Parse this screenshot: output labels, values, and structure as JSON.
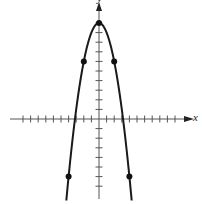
{
  "chart_data": {
    "type": "line",
    "title": "",
    "xlabel": "x",
    "ylabel": "y",
    "function": "y = 10 - x^2",
    "xlim": [
      -10,
      10
    ],
    "ylim": [
      -8,
      10
    ],
    "x_tick_step": 1,
    "y_tick_step": 1,
    "grid": false,
    "legend": null,
    "series": [
      {
        "name": "parabola",
        "x": [
          -4.3,
          -4,
          -3,
          -2,
          -1,
          0,
          1,
          2,
          3,
          4,
          4.3
        ],
        "y": [
          -8.49,
          -6,
          1,
          6,
          9,
          10,
          9,
          6,
          1,
          -6,
          -8.49
        ]
      }
    ],
    "marked_points": [
      {
        "x": -4,
        "y": -6
      },
      {
        "x": -2,
        "y": 6
      },
      {
        "x": 0,
        "y": 10
      },
      {
        "x": 2,
        "y": 6
      },
      {
        "x": 4,
        "y": -6
      }
    ],
    "colors": {
      "curve": "#1a1a1a",
      "axes": "#555555",
      "points": "#111111"
    }
  }
}
